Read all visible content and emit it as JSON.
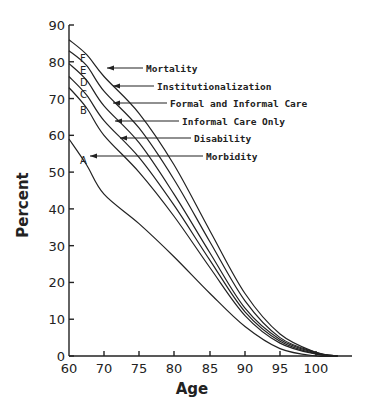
{
  "chart_data": {
    "type": "line",
    "title": "",
    "xlabel": "Age",
    "ylabel": "Percent",
    "xlim": [
      60,
      104
    ],
    "ylim": [
      0,
      90
    ],
    "grid": false,
    "x_ticks": [
      60,
      70,
      75,
      80,
      85,
      90,
      95,
      100
    ],
    "y_ticks": [
      0,
      10,
      20,
      30,
      40,
      50,
      60,
      70,
      80,
      90
    ],
    "x": [
      60,
      65,
      70,
      75,
      80,
      85,
      90,
      95,
      100,
      103
    ],
    "series": [
      {
        "letter": "F",
        "name": "Mortality",
        "values": [
          86,
          82,
          76,
          66,
          52,
          34,
          17,
          6,
          1,
          0
        ]
      },
      {
        "letter": "E",
        "name": "Institutionalization",
        "values": [
          83,
          79,
          72,
          62,
          48,
          31,
          15,
          5,
          1,
          0
        ]
      },
      {
        "letter": "D",
        "name": "Formal and Informal Care",
        "values": [
          79.5,
          75,
          68,
          58,
          44,
          28,
          13,
          4.5,
          0.8,
          0
        ]
      },
      {
        "letter": "C",
        "name": "Informal Care Only",
        "values": [
          76,
          71,
          64,
          54,
          41,
          26,
          12,
          4,
          0.6,
          0
        ]
      },
      {
        "letter": "B",
        "name": "Disability",
        "values": [
          73,
          67.5,
          60,
          50,
          38,
          24,
          11,
          3.5,
          0.5,
          0
        ]
      },
      {
        "letter": "A",
        "name": "Morbidity",
        "values": [
          59,
          52,
          44,
          36,
          27,
          17,
          8,
          2,
          0,
          0
        ]
      }
    ],
    "annotations": [
      {
        "text": "Mortality",
        "points_to": "F"
      },
      {
        "text": "Institutionalization",
        "points_to": "E"
      },
      {
        "text": "Formal and Informal Care",
        "points_to": "D"
      },
      {
        "text": "Informal Care Only",
        "points_to": "C"
      },
      {
        "text": "Disability",
        "points_to": "B"
      },
      {
        "text": "Morbidity",
        "points_to": "A"
      }
    ]
  },
  "layout": {
    "x_tick_px": [
      69,
      104,
      139,
      174,
      210,
      245,
      280,
      316
    ],
    "y_zero_px": 356,
    "y_ninety_px": 25,
    "x_axis_end_px": 352,
    "annotation_rows": [
      {
        "label_x": 146,
        "label_y": 71,
        "arrow_tip_x": 107,
        "arrow_tip_y": 68
      },
      {
        "label_x": 157,
        "label_y": 89,
        "arrow_tip_x": 113,
        "arrow_tip_y": 86
      },
      {
        "label_x": 170,
        "label_y": 107,
        "arrow_tip_x": 113,
        "arrow_tip_y": 103
      },
      {
        "label_x": 182,
        "label_y": 124,
        "arrow_tip_x": 115,
        "arrow_tip_y": 121
      },
      {
        "label_x": 194,
        "label_y": 142,
        "arrow_tip_x": 120,
        "arrow_tip_y": 138
      },
      {
        "label_x": 206,
        "label_y": 160,
        "arrow_tip_x": 90,
        "arrow_tip_y": 156
      }
    ],
    "letter_positions": [
      {
        "letter": "F",
        "x": 80,
        "y": 62
      },
      {
        "letter": "E",
        "x": 80,
        "y": 74
      },
      {
        "letter": "D",
        "x": 80,
        "y": 86
      },
      {
        "letter": "C",
        "x": 80,
        "y": 98
      },
      {
        "letter": "B",
        "x": 80,
        "y": 114
      },
      {
        "letter": "A",
        "x": 80,
        "y": 164
      }
    ]
  }
}
